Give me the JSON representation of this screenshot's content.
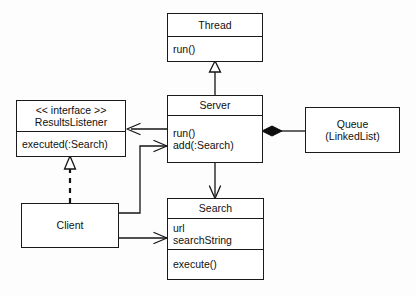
{
  "diagram": {
    "kind": "uml-class-diagram",
    "background_color": "#fdfdfd",
    "line_color": "#141414",
    "box_fill": "#ffffff"
  },
  "classes": {
    "thread": {
      "name": "Thread",
      "operations": [
        "run()"
      ]
    },
    "server": {
      "name": "Server",
      "operations_line1": "run()",
      "operations_line2": "add(:Search)"
    },
    "results_listener": {
      "stereotype": "<< interface >>",
      "name": "ResultsListener",
      "operations": [
        "executed(:Search)"
      ]
    },
    "queue": {
      "name": "Queue",
      "subtitle": "(LinkedList)"
    },
    "client": {
      "name": "Client"
    },
    "search": {
      "name": "Search",
      "attributes_line1": "url",
      "attributes_line2": "searchString",
      "operations": [
        "execute()"
      ]
    }
  },
  "relationships": [
    {
      "id": "server-extends-thread",
      "type": "generalization",
      "from": "Server",
      "to": "Thread",
      "arrowhead": "hollow-triangle",
      "line": "solid"
    },
    {
      "id": "client-implements-resultslistener",
      "type": "realization",
      "from": "Client",
      "to": "ResultsListener",
      "arrowhead": "hollow-triangle",
      "line": "dashed"
    },
    {
      "id": "server-uses-resultslistener",
      "type": "association",
      "from": "Server",
      "to": "ResultsListener",
      "arrowhead": "open-arrow",
      "line": "solid"
    },
    {
      "id": "server-composes-queue",
      "type": "composition",
      "from": "Server",
      "to": "Queue",
      "arrowhead": "filled-diamond",
      "line": "solid"
    },
    {
      "id": "server-uses-search",
      "type": "association",
      "from": "Server",
      "to": "Search",
      "arrowhead": "open-arrow",
      "line": "solid"
    },
    {
      "id": "client-calls-server",
      "type": "association",
      "from": "Client",
      "to": "Server",
      "arrowhead": "open-arrow",
      "line": "solid"
    },
    {
      "id": "client-uses-search",
      "type": "association",
      "from": "Client",
      "to": "Search",
      "arrowhead": "open-arrow",
      "line": "solid"
    }
  ]
}
